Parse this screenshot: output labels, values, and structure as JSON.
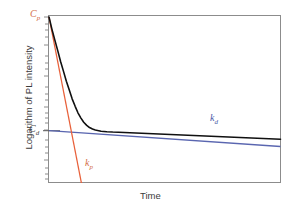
{
  "figure": {
    "background": "#ffffff",
    "plot_border_color": "#8c8c8c",
    "axes": {
      "xlabel": "Time",
      "ylabel": "Logarithm of PL intensity",
      "x_ticks": [],
      "y_ticks": [],
      "y_scale": "log-minor-ticks",
      "grid": false
    },
    "labels": {
      "cp": {
        "text": "C",
        "sub": "p",
        "color": "#d4704a"
      },
      "cd": {
        "text": "C",
        "sub": "d",
        "color": "#4a4a4a"
      },
      "kp": {
        "text": "k",
        "sub": "p",
        "color": "#d4704a"
      },
      "kd": {
        "text": "k",
        "sub": "d",
        "color": "#4a5aa8"
      }
    }
  },
  "chart_data": {
    "type": "line",
    "title": "",
    "subtitle": "",
    "xlabel": "Time",
    "ylabel": "Logarithm of PL intensity",
    "xlim": [
      0,
      1
    ],
    "ylim": [
      0,
      1
    ],
    "grid": false,
    "legend": "inline-annotations",
    "annotations": [
      {
        "name": "Cp",
        "label": "C_p",
        "color": "#d4704a",
        "x": 0.0,
        "y": 1.0,
        "description": "Prompt-component amplitude intercept at the y-axis"
      },
      {
        "name": "Cd",
        "label": "C_d",
        "color": "#4a4a4a",
        "x": 0.0,
        "y": 0.315,
        "description": "Delayed-component amplitude intercept at the y-axis"
      },
      {
        "name": "kp",
        "label": "k_p",
        "color": "#d4704a",
        "x": 0.155,
        "y": 0.155,
        "description": "Slope of the prompt decay line"
      },
      {
        "name": "kd",
        "label": "k_d",
        "color": "#4a5aa8",
        "x": 0.7,
        "y": 0.42,
        "description": "Slope of the delayed decay line"
      }
    ],
    "series": [
      {
        "name": "total PL decay",
        "style": "solid",
        "color": "#101010",
        "width": 1.6,
        "comment": "Sum of prompt and delayed exponentials: y = log(Cp*exp(-kp*t) + Cd*exp(-kd*t))",
        "x": [
          0.0,
          0.012,
          0.025,
          0.038,
          0.05,
          0.063,
          0.075,
          0.088,
          0.1,
          0.113,
          0.125,
          0.138,
          0.15,
          0.163,
          0.175,
          0.188,
          0.2,
          0.225,
          0.25,
          0.275,
          0.3,
          0.35,
          0.4,
          0.45,
          0.5,
          0.6,
          0.7,
          0.8,
          0.9,
          1.0
        ],
        "y": [
          1.0,
          0.93,
          0.862,
          0.796,
          0.732,
          0.671,
          0.613,
          0.558,
          0.507,
          0.462,
          0.423,
          0.391,
          0.366,
          0.347,
          0.334,
          0.325,
          0.319,
          0.312,
          0.309,
          0.307,
          0.306,
          0.303,
          0.3,
          0.297,
          0.294,
          0.288,
          0.282,
          0.276,
          0.27,
          0.264
        ]
      },
      {
        "name": "prompt component kp",
        "style": "solid",
        "color": "#e8603a",
        "width": 1.3,
        "comment": "Straight line of slope -kp through Cp",
        "x": [
          0.0,
          0.14
        ],
        "y": [
          1.0,
          0.0
        ]
      },
      {
        "name": "delayed component kd",
        "style": "solid",
        "color": "#5a66b0",
        "width": 1.3,
        "comment": "Straight line of shallow slope -kd through Cd",
        "x": [
          0.0,
          1.0
        ],
        "y": [
          0.315,
          0.22
        ]
      }
    ]
  }
}
